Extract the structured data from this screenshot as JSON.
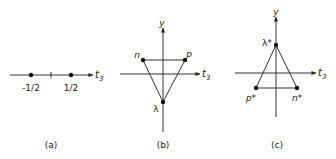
{
  "figure": {
    "panels": [
      {
        "id": "a",
        "caption": "(a)",
        "axis_label": "t",
        "axis_subscript": "3",
        "points": [
          {
            "label": "-1/2",
            "value": -0.5
          },
          {
            "label": "1/2",
            "value": 0.5
          }
        ]
      },
      {
        "id": "b",
        "caption": "(b)",
        "x_axis_label": "t",
        "x_axis_subscript": "3",
        "y_axis_label": "y",
        "points": [
          {
            "label": "n",
            "t3": -0.5,
            "y": 1
          },
          {
            "label": "p",
            "t3": 0.5,
            "y": 1
          },
          {
            "label": "λ",
            "t3": 0,
            "y": -2
          }
        ]
      },
      {
        "id": "c",
        "caption": "(c)",
        "x_axis_label": "t",
        "x_axis_subscript": "3",
        "y_axis_label": "y",
        "points": [
          {
            "label": "λ*",
            "t3": 0,
            "y": 2
          },
          {
            "label": "p*",
            "t3": -0.5,
            "y": -1
          },
          {
            "label": "n*",
            "t3": 0.5,
            "y": -1
          }
        ]
      }
    ]
  },
  "colors": {
    "line": "#333333",
    "point": "#111111",
    "background": "#ffffff"
  }
}
